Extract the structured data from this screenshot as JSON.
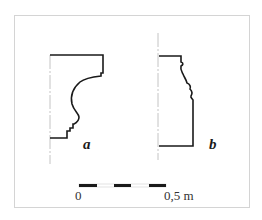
{
  "figure": {
    "profiles": [
      {
        "id": "a",
        "label": "a"
      },
      {
        "id": "b",
        "label": "b"
      }
    ],
    "scale_bar": {
      "start_label": "0",
      "end_label": "0,5 m",
      "segments": 5
    },
    "colors": {
      "line": "#1a1a1a",
      "axis": "#bfbfbf",
      "frame": "#d4d4d4"
    }
  }
}
